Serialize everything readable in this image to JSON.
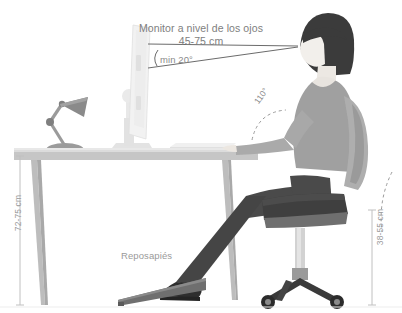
{
  "diagram": {
    "language": "es",
    "background_color": "#ffffff"
  },
  "annotations": {
    "monitor_title_line1": "Monitor a nivel de los ojos",
    "monitor_title_line2": "45-75 cm",
    "view_angle": "min 20°",
    "elbow_angle": "110°",
    "desk_height": "72-75 cm",
    "seat_height": "38-55 cm",
    "footrest": "Reposapiés"
  },
  "measurements": {
    "monitor_distance_cm": [
      45,
      75
    ],
    "view_angle_deg_min": 20,
    "elbow_angle_deg": 110,
    "desk_height_cm": [
      72,
      75
    ],
    "seat_height_cm": [
      38,
      55
    ]
  },
  "objects": [
    {
      "name": "monitor",
      "description": "flat panel monitor on stand, side view"
    },
    {
      "name": "desk-lamp",
      "description": "articulated gray desk lamp"
    },
    {
      "name": "desk",
      "description": "desk with two legs"
    },
    {
      "name": "keyboard",
      "description": "keyboard on desk surface"
    },
    {
      "name": "person",
      "description": "seated person, side profile, facing left"
    },
    {
      "name": "office-chair",
      "description": "swivel chair, five-star base with casters"
    },
    {
      "name": "footrest",
      "description": "angled wedge footrest"
    }
  ],
  "colors": {
    "text": "#8c8c8c",
    "line": "#6b6b6b",
    "dashed": "#9a9a9a",
    "hair": "#3b3b3b",
    "skin": "#f0ece8",
    "shirt": "#9e9e9e",
    "trousers": "#4a4a4a",
    "chair_seat": "#3f3f3f",
    "chair_back": "#a8a8a8",
    "desk_top": "#d8d8d8",
    "desk_edge": "#bdbdbd",
    "monitor": "#ededed",
    "lamp": "#9b9b9b",
    "footrest": "#6e6e6e"
  }
}
